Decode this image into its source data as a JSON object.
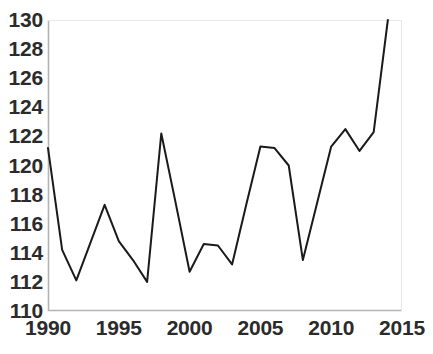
{
  "chart_data": {
    "type": "line",
    "title": "",
    "subtitle": "",
    "xlabel": "",
    "ylabel": "",
    "xlim": [
      1990,
      2015
    ],
    "ylim": [
      110,
      130
    ],
    "xticks": [
      1990,
      1995,
      2000,
      2005,
      2010,
      2015
    ],
    "yticks": [
      110,
      112,
      114,
      116,
      118,
      120,
      122,
      124,
      126,
      128,
      130
    ],
    "xtick_labels": [
      "1990",
      "1995",
      "2000",
      "2005",
      "2010",
      "2015"
    ],
    "ytick_labels": [
      "110",
      "112",
      "114",
      "116",
      "118",
      "120",
      "122",
      "124",
      "126",
      "128",
      "130"
    ],
    "grid": false,
    "legend": null,
    "legend_position": "none",
    "annotations": [],
    "line_color": "#1a1a1a",
    "line_width": 2,
    "axis_color": "#b4b4b4",
    "background_color": "#ffffff",
    "x": [
      1990,
      1991,
      1992,
      1993,
      1994,
      1995,
      1996,
      1997,
      1998,
      1999,
      2000,
      2001,
      2002,
      2003,
      2004,
      2005,
      2006,
      2007,
      2008,
      2009,
      2010,
      2011,
      2012,
      2013,
      2014
    ],
    "series": [
      {
        "name": "value",
        "values": [
          121.2,
          114.2,
          112.1,
          114.7,
          117.3,
          114.8,
          113.5,
          112.0,
          122.2,
          117.5,
          112.7,
          114.6,
          114.5,
          113.2,
          117.3,
          121.3,
          121.2,
          120.0,
          113.5,
          117.4,
          121.3,
          122.5,
          121.0,
          122.3,
          130.0
        ]
      }
    ]
  }
}
